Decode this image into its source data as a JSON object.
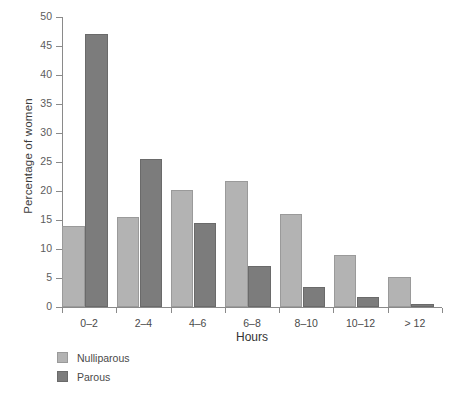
{
  "chart_data": {
    "type": "bar",
    "title": "",
    "xlabel": "Hours",
    "ylabel": "Percentage of women",
    "categories": [
      "0–2",
      "2–4",
      "4–6",
      "6–8",
      "8–10",
      "10–12",
      "> 12"
    ],
    "series": [
      {
        "name": "Nulliparous",
        "color": "#b3b3b3",
        "values": [
          14.0,
          15.5,
          20.2,
          21.8,
          16.1,
          9.0,
          5.1
        ]
      },
      {
        "name": "Parous",
        "color": "#7c7c7c",
        "values": [
          47.1,
          25.6,
          14.5,
          7.1,
          3.5,
          1.7,
          0.6
        ]
      }
    ],
    "ylim": [
      0,
      50
    ],
    "yticks": [
      0,
      5,
      10,
      15,
      20,
      25,
      30,
      35,
      40,
      45,
      50
    ],
    "ytick_labels": [
      "0",
      "5",
      "10",
      "15",
      "20",
      "25",
      "30",
      "35",
      "40",
      "45",
      "50"
    ],
    "grid": false,
    "legend_position": "bottom-left"
  },
  "legend": {
    "items": [
      {
        "label": "Nulliparous",
        "swatch": "nulliparous"
      },
      {
        "label": "Parous",
        "swatch": "parous"
      }
    ]
  }
}
